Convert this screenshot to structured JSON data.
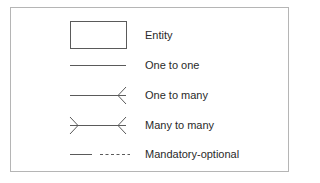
{
  "legend": {
    "items": [
      {
        "symbol": "entity-box",
        "label": "Entity"
      },
      {
        "symbol": "plain-line",
        "label": "One to one"
      },
      {
        "symbol": "line-with-crows-foot-right",
        "label": "One to many"
      },
      {
        "symbol": "line-with-crows-foot-both-ends",
        "label": "Many to many"
      },
      {
        "symbol": "solid-then-dashed-line",
        "label": "Mandatory-optional"
      }
    ]
  },
  "colors": {
    "line": "#5a5a5a",
    "frame": "#b5b5b5",
    "text": "#2a2a2a"
  }
}
